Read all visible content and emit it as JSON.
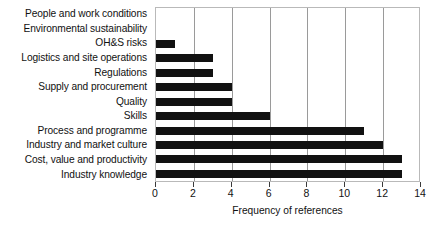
{
  "chart_data": {
    "type": "bar",
    "orientation": "horizontal",
    "title": "",
    "xlabel": "Frequency of references",
    "ylabel": "",
    "xlim": [
      0,
      14
    ],
    "xticks": [
      0,
      2,
      4,
      6,
      8,
      10,
      12,
      14
    ],
    "grid": "vertical",
    "legend": "none",
    "bar_color": "#111111",
    "gridline_color": "#9a9a9a",
    "border_color": "#b9b9b9",
    "categories": [
      "People and work conditions",
      "Environmental sustainability",
      "OH&S risks",
      "Logistics and site operations",
      "Regulations",
      "Supply and procurement",
      "Quality",
      "Skills",
      "Process and programme",
      "Industry and market culture",
      "Cost, value and productivity",
      "Industry knowledge"
    ],
    "values": [
      0,
      0,
      1,
      3,
      3,
      4,
      4,
      6,
      11,
      12,
      13,
      13
    ]
  }
}
